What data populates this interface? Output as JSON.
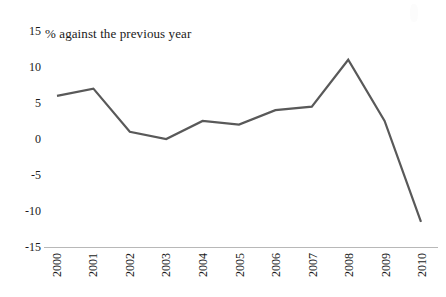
{
  "chart_data": {
    "type": "line",
    "title": "% against the previous year",
    "subtitle": "",
    "xlabel": "",
    "ylabel": "",
    "categories": [
      "2000",
      "2001",
      "2002",
      "2003",
      "2004",
      "2005",
      "2006",
      "2007",
      "2008",
      "2009",
      "2010"
    ],
    "values": [
      6,
      7,
      1,
      0,
      2.5,
      2,
      4,
      4.5,
      11,
      2.5,
      -11.5
    ],
    "series": [
      {
        "name": "% against the previous year",
        "values": [
          6,
          7,
          1,
          0,
          2.5,
          2,
          4,
          4.5,
          11,
          2.5,
          -11.5
        ]
      }
    ],
    "ylim": [
      -15,
      15
    ],
    "y_ticks": [
      15,
      10,
      5,
      0,
      -5,
      -10,
      -15
    ],
    "y_tick_labels": [
      "15",
      "10",
      "5",
      "0",
      "-5",
      "-10",
      "-15"
    ],
    "x_tick_labels": [
      "2000",
      "2001",
      "2002",
      "2003",
      "2004",
      "2005",
      "2006",
      "2007",
      "2008",
      "2009",
      "2010"
    ],
    "x_tick_rotation": 90,
    "grid": false,
    "legend": false,
    "legend_position": "none",
    "markers": false,
    "colors": {
      "line": "#595959",
      "axis": "#b8b8b8",
      "text": "#1a1a1a",
      "background": "#ffffff"
    },
    "annotations": []
  },
  "axis": {
    "y_labels": [
      "15",
      "10",
      "5",
      "0",
      "-5",
      "-10",
      "-15"
    ],
    "x_labels": [
      "2000",
      "2001",
      "2002",
      "2003",
      "2004",
      "2005",
      "2006",
      "2007",
      "2008",
      "2009",
      "2010"
    ]
  },
  "title": {
    "text": "% against the previous year"
  }
}
